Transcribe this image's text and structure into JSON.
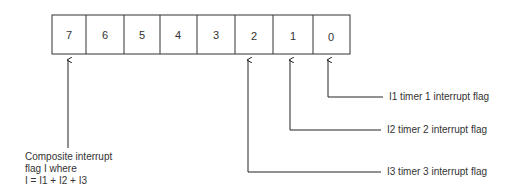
{
  "register": {
    "bits": [
      "7",
      "6",
      "5",
      "4",
      "3",
      "2",
      "1",
      "0"
    ]
  },
  "labels": {
    "i1": "I1 timer 1 interrupt flag",
    "i2": "I2 timer 2 interrupt flag",
    "i3": "I3 timer 3 interrupt flag",
    "composite_line1": "Composite interrupt",
    "composite_line2": "flag I where",
    "composite_line3": "I = I1 + I2 + I3"
  }
}
